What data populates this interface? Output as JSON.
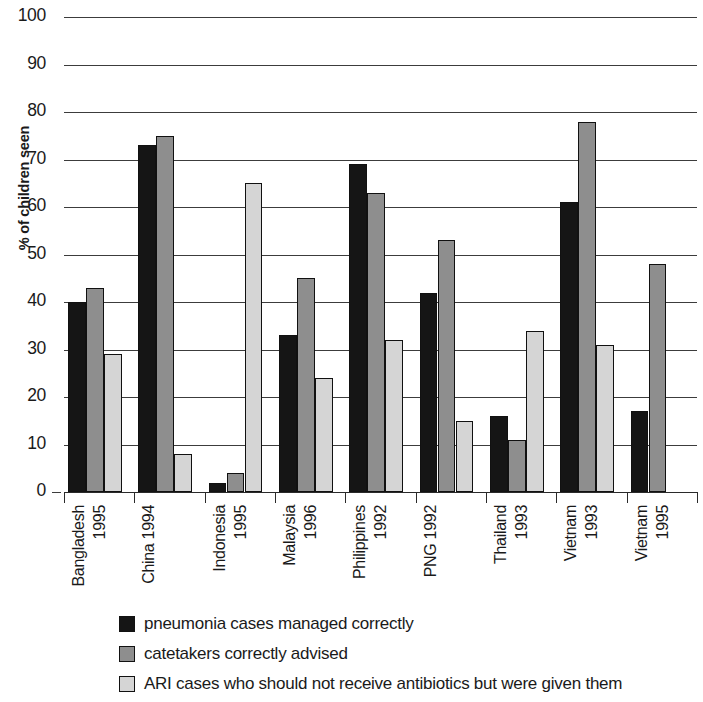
{
  "chart_data": {
    "type": "bar",
    "title": "",
    "xlabel": "",
    "ylabel": "% of children seen",
    "ylim": [
      0,
      100
    ],
    "yticks": [
      0,
      10,
      20,
      30,
      40,
      50,
      60,
      70,
      80,
      90,
      100
    ],
    "grid": true,
    "legend_position": "bottom-left",
    "categories": [
      "Bangladesh 1995",
      "China 1994",
      "Indonesia 1995",
      "Malaysia 1996",
      "Philippines 1992",
      "PNG 1992",
      "Thailand 1993",
      "Vietnam 1993",
      "Vietnam 1995"
    ],
    "category_lines": [
      [
        "Bangladesh",
        "1995"
      ],
      [
        "China 1994",
        ""
      ],
      [
        "Indonesia",
        "1995"
      ],
      [
        "Malaysia",
        "1996"
      ],
      [
        "Philippines",
        "1992"
      ],
      [
        "PNG 1992",
        ""
      ],
      [
        "Thailand",
        "1993"
      ],
      [
        "Vietnam",
        "1993"
      ],
      [
        "Vietnam",
        "1995"
      ]
    ],
    "series": [
      {
        "name": "pneumonia cases managed correctly",
        "color": "#151515",
        "values": [
          40,
          73,
          2,
          33,
          69,
          42,
          16,
          61,
          17
        ]
      },
      {
        "name": "catetakers correctly advised",
        "color": "#8e8e8e",
        "values": [
          43,
          75,
          4,
          45,
          63,
          53,
          11,
          78,
          48
        ]
      },
      {
        "name": "ARI cases who should not receive antibiotics but were given them",
        "color": "#d5d5d5",
        "values": [
          29,
          8,
          65,
          24,
          32,
          15,
          34,
          31,
          null
        ]
      }
    ]
  },
  "legend": {
    "items": [
      {
        "label": "pneumonia cases managed correctly",
        "swatch": "s0"
      },
      {
        "label": "catetakers correctly advised",
        "swatch": "s1"
      },
      {
        "label": "ARI cases who should not receive antibiotics but were given them",
        "swatch": "s2"
      }
    ]
  }
}
